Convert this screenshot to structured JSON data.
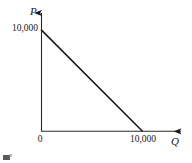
{
  "figure": {
    "kind": "line-chart",
    "background_color": "#ffffff",
    "ink_color": "#1a1a1a",
    "artifacts": {
      "scan_speck_label": "scan-speck",
      "ghost_text_note": "faint bleed-through from reverse of page, illegible",
      "ghost_lines": [
        "",
        "",
        "",
        ""
      ]
    }
  },
  "chart_data": {
    "type": "line",
    "title": "",
    "subtitle": "",
    "xlabel": "Q",
    "ylabel": "P",
    "xlim": [
      0,
      14000
    ],
    "ylim": [
      0,
      11800
    ],
    "grid": false,
    "legend": null,
    "axis_arrows": true,
    "x_tick_labels": [
      "0",
      "10,000"
    ],
    "x_tick_values": [
      0,
      10000
    ],
    "y_tick_labels": [
      "10,000"
    ],
    "y_tick_values": [
      10000
    ],
    "origin_label": "0",
    "series": [
      {
        "name": "demand",
        "x": [
          0,
          10000
        ],
        "y": [
          10000,
          0
        ],
        "color": "#1a1a1a",
        "width": 1.6,
        "annotations": []
      }
    ]
  },
  "labels": {
    "y_axis_name": "P",
    "x_axis_name": "Q",
    "y_intercept": "10,000",
    "x_intercept": "10,000",
    "origin": "0"
  }
}
